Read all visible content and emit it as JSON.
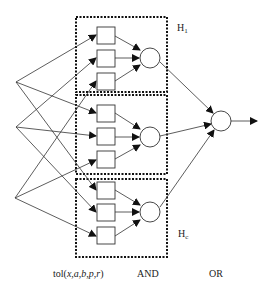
{
  "diagram": {
    "type": "fuzzy-network",
    "group_labels": {
      "first": {
        "main": "H",
        "sub": "1"
      },
      "last": {
        "main": "H",
        "sub": "c"
      }
    },
    "layer_labels": {
      "tolerance": {
        "prefix": "tol(",
        "args": "x,a,b,p,r",
        "suffix": ")"
      },
      "and": "AND",
      "or": "OR"
    },
    "inputs": 3,
    "groups": 3,
    "tolerance_nodes_per_group": 3,
    "colors": {
      "stroke": "#222222",
      "background": "#ffffff"
    }
  }
}
